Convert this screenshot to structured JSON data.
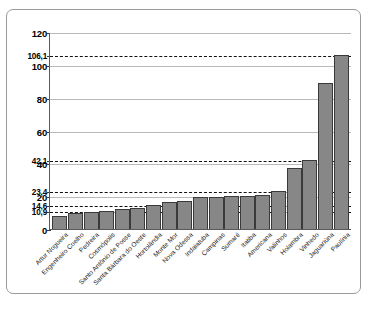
{
  "chart_data": {
    "type": "bar",
    "title": "",
    "xlabel": "",
    "ylabel": "",
    "ylim": [
      0,
      120
    ],
    "grid": true,
    "legend": null,
    "categories": [
      "Artur Nogueira",
      "Engenheiro Coelho",
      "Pedreira",
      "Cosmópolis",
      "Santo Antônio de Posse",
      "Santa Bárbara do Oeste",
      "Hortolândia",
      "Monte Mor",
      "Nova Odessa",
      "Indaiatuba",
      "Campinas",
      "Sumaré",
      "Itatiba",
      "Americana",
      "Valinhos",
      "Holambra",
      "Vinhedo",
      "Jaguariúna",
      "Paulínia"
    ],
    "values": [
      8.0,
      10.0,
      10.6,
      10.9,
      12.4,
      12.6,
      14.6,
      16.2,
      17.2,
      19.4,
      19.4,
      20.0,
      20.0,
      20.6,
      23.4,
      37.0,
      42.1,
      89.0,
      106.1
    ],
    "y_ticks": [
      "0",
      "20",
      "40",
      "60",
      "80",
      "100",
      "120"
    ],
    "y_tick_values": [
      0,
      20,
      40,
      60,
      80,
      100,
      120
    ],
    "reference_lines": [
      {
        "label": "10,9",
        "value": 10.9
      },
      {
        "label": "14,6",
        "value": 14.6
      },
      {
        "label": "23,4",
        "value": 23.4
      },
      {
        "label": "42,1",
        "value": 42.1
      },
      {
        "label": "106,1",
        "value": 106.1
      }
    ],
    "bar_color": "#878787",
    "gridline_color": "#b9b9b9",
    "reference_line_color": "#111111"
  },
  "caption": {
    "text": ""
  }
}
